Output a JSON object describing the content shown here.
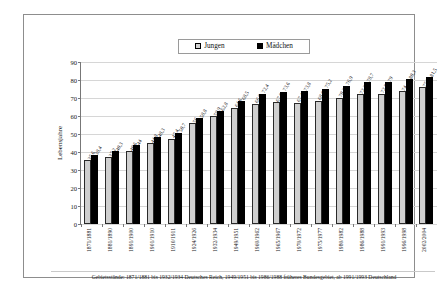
{
  "chart_data": {
    "type": "bar",
    "title": "",
    "xlabel": "",
    "ylabel": "Lebensjahre",
    "ylim": [
      0,
      90
    ],
    "yticks": [
      0,
      10,
      20,
      30,
      40,
      50,
      60,
      70,
      80,
      90
    ],
    "grid": true,
    "legend_position": "top-center",
    "categories": [
      "1871/1881",
      "1881/1890",
      "1891/1900",
      "1901/1910",
      "1910/1911",
      "1924/1926",
      "1932/1934",
      "1949/1951",
      "1960/1962",
      "1965/1967",
      "1970/1972",
      "1975/1977",
      "1980/1982",
      "1986/1988",
      "1991/1993",
      "1996/1998",
      "2002/2004"
    ],
    "series": [
      {
        "name": "Jungen",
        "color": "#cfcfcf",
        "values": [
          35.6,
          37.2,
          40.6,
          44.8,
          47.4,
          56.0,
          59.9,
          64.6,
          66.9,
          67.6,
          67.4,
          68.6,
          70.2,
          72.2,
          72.5,
          74.0,
          75.9
        ]
      },
      {
        "name": "Mädchen",
        "color": "#000000",
        "values": [
          38.4,
          40.3,
          44.0,
          48.3,
          50.7,
          58.8,
          62.8,
          68.5,
          72.4,
          73.6,
          73.8,
          75.2,
          76.9,
          78.7,
          79.0,
          80.3,
          81.5
        ]
      }
    ],
    "footnote": "Gebietsstände: 1871/1881 bis 1932/1934 Deutsches Reich, 1949/1951 bis 1986/1988 früheres Bundesgebiet, ab 1991/1993 Deutschland"
  },
  "legend": {
    "jungen": "Jungen",
    "maedchen": "Mädchen"
  }
}
